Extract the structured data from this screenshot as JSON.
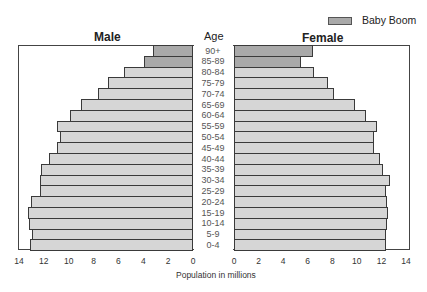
{
  "chart_data": {
    "type": "bar",
    "subtype": "population-pyramid",
    "title_left": "Male",
    "title_center": "Age",
    "title_right": "Female",
    "xlabel": "Population in millions",
    "ylabel": "Age",
    "xlim": [
      0,
      14
    ],
    "x_ticks_left": [
      "14",
      "12",
      "10",
      "8",
      "6",
      "4",
      "2",
      "0"
    ],
    "x_ticks_right": [
      "0",
      "2",
      "4",
      "6",
      "8",
      "10",
      "12",
      "14"
    ],
    "legend": [
      {
        "label": "Baby Boom",
        "color": "#a9a9a9"
      }
    ],
    "legend_position": "top-right",
    "categories": [
      "90+",
      "85-89",
      "80-84",
      "75-79",
      "70-74",
      "65-69",
      "60-64",
      "55-59",
      "50-54",
      "45-49",
      "40-44",
      "35-39",
      "30-34",
      "25-29",
      "20-24",
      "15-19",
      "10-14",
      "5-9",
      "0-4"
    ],
    "series": [
      {
        "name": "Male",
        "values": [
          3.2,
          4.0,
          5.6,
          6.9,
          7.7,
          9.1,
          10.0,
          11.0,
          10.8,
          11.0,
          11.7,
          12.3,
          12.4,
          12.4,
          13.1,
          13.4,
          13.3,
          13.0,
          13.2
        ]
      },
      {
        "name": "Female",
        "values": [
          6.4,
          5.4,
          6.5,
          7.6,
          8.1,
          9.8,
          10.7,
          11.6,
          11.3,
          11.3,
          11.8,
          12.1,
          12.6,
          12.3,
          12.4,
          12.5,
          12.4,
          12.3,
          12.3
        ]
      }
    ],
    "highlight_rows": [
      "90+",
      "85-89"
    ],
    "colors": {
      "highlight": "#a9a9a9",
      "normal": "#d6d6d6",
      "border": "#3a3a3a"
    }
  }
}
